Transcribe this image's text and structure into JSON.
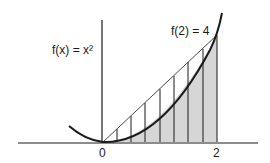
{
  "diagram": {
    "function_label": "f(x) = x²",
    "point_label": "f(2) = 4",
    "x_ticks": [
      {
        "value": 0,
        "label": "0"
      },
      {
        "value": 2,
        "label": "2"
      }
    ],
    "partition_count": 8,
    "partition_points": [
      0.25,
      0.5,
      0.75,
      1.0,
      1.25,
      1.5,
      1.75,
      2.0
    ],
    "colors": {
      "ink": "#1a1a1a",
      "shade": "#d6d6d6",
      "background": "#ffffff"
    }
  }
}
